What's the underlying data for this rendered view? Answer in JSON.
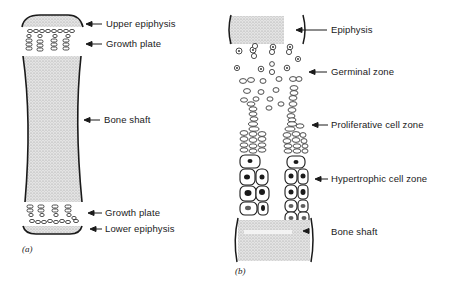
{
  "panel_a": {
    "caption": "(a)",
    "labels": {
      "upper_epiphysis": "Upper epiphysis",
      "growth_plate_top": "Growth plate",
      "bone_shaft": "Bone shaft",
      "growth_plate_bottom": "Growth plate",
      "lower_epiphysis": "Lower epiphysis"
    }
  },
  "panel_b": {
    "caption": "(b)",
    "labels": {
      "epiphysis": "Epiphysis",
      "germinal_zone": "Germinal zone",
      "proliferative_zone": "Proliferative cell zone",
      "hypertrophic_zone": "Hypertrophic cell zone",
      "bone_shaft": "Bone shaft"
    }
  },
  "colors": {
    "line": "#1a1a1a",
    "stipple": "#c8c8c8"
  }
}
